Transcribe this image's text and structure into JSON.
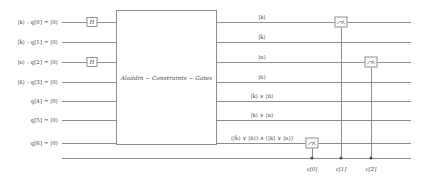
{
  "diagram": {
    "gate_box_label": "Aladdin − Constraints − Gates",
    "wire_color": "#8d8d93",
    "text_color": "#3d3d42",
    "background": "#ffffff"
  },
  "qubits": [
    {
      "index": 0,
      "input_label": "|k⟩ : q[0] = |0⟩",
      "output_label": "|k⟩",
      "y": 22,
      "hadamard": true
    },
    {
      "index": 1,
      "input_label": "|k̄⟩ : q[1] = |0⟩",
      "output_label": "|k̄⟩",
      "y": 42,
      "hadamard": false
    },
    {
      "index": 2,
      "input_label": "|n⟩ : q[2] = |0⟩",
      "output_label": "|n⟩",
      "y": 62,
      "hadamard": true
    },
    {
      "index": 3,
      "input_label": "|n̄⟩ : q[3] = |0⟩",
      "output_label": "|n̄⟩",
      "y": 82,
      "hadamard": false
    },
    {
      "index": 4,
      "input_label": "q[4] = |0⟩",
      "output_label": "|k̄⟩ ∨ |n̄⟩",
      "y": 101,
      "hadamard": false
    },
    {
      "index": 5,
      "input_label": "q[5] = |0⟩",
      "output_label": "|k⟩ ∨ |n⟩",
      "y": 120,
      "hadamard": false
    },
    {
      "index": 6,
      "input_label": "q[6] = |0⟩",
      "output_label": "(|k̄⟩ ∨ |n̄⟩) ∧ (|k⟩ ∨ |n⟩)",
      "y": 143,
      "hadamard": false
    }
  ],
  "classical_register": {
    "bus_y": 158,
    "bits": [
      {
        "label": "c[0]",
        "x": 312,
        "from_qubit": 6
      },
      {
        "label": "c[1]",
        "x": 341,
        "from_qubit": 0
      },
      {
        "label": "c[2]",
        "x": 371,
        "from_qubit": 2
      }
    ]
  },
  "gates": {
    "hadamard_label": "H",
    "hadamard_x": 92,
    "measurement_icon": "measure-meter-icon",
    "measurements": [
      {
        "qubit": 0,
        "x": 341,
        "y": 22,
        "classical_bit": "c[1]"
      },
      {
        "qubit": 2,
        "x": 371,
        "y": 62,
        "classical_bit": "c[2]"
      },
      {
        "qubit": 6,
        "x": 312,
        "y": 143,
        "classical_bit": "c[0]"
      }
    ],
    "box": {
      "x": 116,
      "y": 10,
      "width": 101,
      "height": 135
    }
  },
  "layout": {
    "wire_left": 62,
    "wire_right": 411,
    "label_right": 58,
    "bus_left": 62,
    "bus_right": 411,
    "cbit_label_y": 168
  }
}
